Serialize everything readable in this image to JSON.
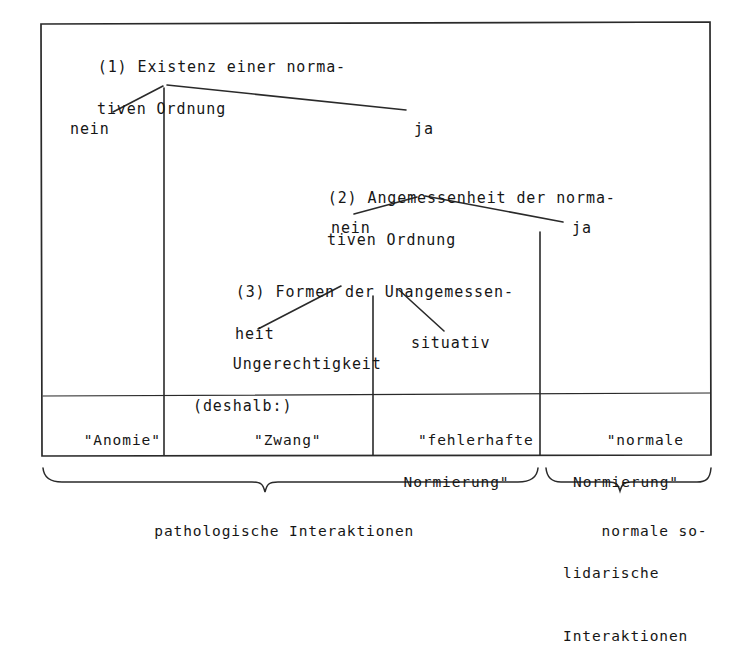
{
  "diagram": {
    "frame": {
      "border_color": "#2a2a2a",
      "background": "#ffffff"
    },
    "nodes": [
      {
        "id": "node1",
        "number": "(1)",
        "line1": "Existenz einer norma-",
        "line2": "tiven Ordnung"
      },
      {
        "id": "node2",
        "number": "(2)",
        "line1": "Angemessenheit der norma-",
        "line2": "tiven Ordnung"
      },
      {
        "id": "node3",
        "number": "(3)",
        "line1": "Formen der Unangemessen-",
        "line2": "heit"
      }
    ],
    "branch_labels": {
      "level1_no": "nein",
      "level1_yes": "ja",
      "level2_no": "nein",
      "level2_yes": "ja",
      "level3_left": "Ungerechtigkeit",
      "level3_left_sub": "(deshalb:)",
      "level3_right": "situativ"
    },
    "outcome_cells": [
      {
        "id": "cell-anomie",
        "line1": "\"Anomie\"",
        "line2": ""
      },
      {
        "id": "cell-zwang",
        "line1": "\"Zwang\"",
        "line2": ""
      },
      {
        "id": "cell-fehlerhafte",
        "line1": "\"fehlerhafte",
        "line2": "Normierung\""
      },
      {
        "id": "cell-normale",
        "line1": "\"normale",
        "line2": "Normierung\""
      }
    ],
    "braces": [
      {
        "id": "brace-pathologisch",
        "caption_lines": [
          "pathologische Interaktionen"
        ]
      },
      {
        "id": "brace-normal",
        "caption_lines": [
          "normale so-",
          "lidarische",
          "Interaktionen"
        ]
      }
    ]
  }
}
